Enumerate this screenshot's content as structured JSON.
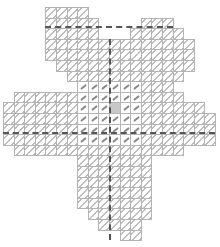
{
  "diagram": {
    "title": "",
    "type": "needlepoint stitch chart",
    "shape": "four-petal flower / cross",
    "grid": {
      "origin_x": 3,
      "origin_y": 7,
      "cell": 10.6,
      "cols": 20,
      "rows": 22
    },
    "colors": {
      "grid_line": "#b4b4b4",
      "hatch": "#bdbdbd",
      "stitch": "#8a8a8a",
      "center": "#c8c8c8",
      "center_line": "#555555"
    },
    "rows": [
      {
        "r": 0,
        "spans": [
          [
            4,
            7
          ]
        ]
      },
      {
        "r": 1,
        "spans": [
          [
            4,
            8
          ],
          [
            13,
            15
          ]
        ]
      },
      {
        "r": 2,
        "spans": [
          [
            4,
            8
          ],
          [
            12,
            16
          ]
        ]
      },
      {
        "r": 3,
        "spans": [
          [
            4,
            9
          ],
          [
            10,
            17
          ]
        ]
      },
      {
        "r": 4,
        "spans": [
          [
            4,
            17
          ]
        ]
      },
      {
        "r": 5,
        "spans": [
          [
            5,
            17
          ]
        ]
      },
      {
        "r": 6,
        "spans": [
          [
            6,
            16
          ]
        ]
      },
      {
        "r": 7,
        "spans": [
          [
            7,
            15
          ]
        ]
      },
      {
        "r": 8,
        "spans": [
          [
            1,
            16
          ]
        ]
      },
      {
        "r": 9,
        "spans": [
          [
            0,
            18
          ]
        ]
      },
      {
        "r": 10,
        "spans": [
          [
            0,
            19
          ]
        ]
      },
      {
        "r": 11,
        "spans": [
          [
            0,
            19
          ]
        ]
      },
      {
        "r": 12,
        "spans": [
          [
            0,
            19
          ]
        ]
      },
      {
        "r": 13,
        "spans": [
          [
            1,
            16
          ]
        ]
      },
      {
        "r": 14,
        "spans": [
          [
            7,
            13
          ]
        ]
      },
      {
        "r": 15,
        "spans": [
          [
            7,
            13
          ]
        ]
      },
      {
        "r": 16,
        "spans": [
          [
            7,
            13
          ]
        ]
      },
      {
        "r": 17,
        "spans": [
          [
            7,
            13
          ]
        ]
      },
      {
        "r": 18,
        "spans": [
          [
            7,
            13
          ]
        ]
      },
      {
        "r": 19,
        "spans": [
          [
            8,
            13
          ]
        ]
      },
      {
        "r": 20,
        "spans": [
          [
            9,
            12
          ]
        ]
      },
      {
        "r": 21,
        "spans": [
          [
            11,
            12
          ]
        ]
      }
    ],
    "stitch_region": {
      "col_start": 7,
      "col_end": 12,
      "row_start": 7,
      "row_end": 12
    },
    "center_cell": {
      "col": 10,
      "row": 9
    },
    "center_lines": {
      "horizontal_rows": [
        1,
        11
      ],
      "vertical_col": 10
    }
  }
}
